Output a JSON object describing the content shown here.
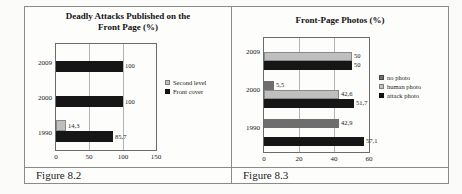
{
  "figures": [
    {
      "caption": "Figure 8.2"
    },
    {
      "caption": "Figure 8.3"
    }
  ],
  "colors": {
    "table_border": "#8a8a8a",
    "plot_border": "#6b6b6b",
    "gridline": "#b3b3b3",
    "black_series": "#161616",
    "light_gray_series": "#bfbfbf",
    "dark_gray_series": "#6e6e6e"
  },
  "chart_data": [
    {
      "type": "bar",
      "orientation": "horizontal",
      "title": "Deadly Attacks Published on the Front Page (%)",
      "title_lines": [
        "Deadly Attacks Published on the",
        "Front Page (%)"
      ],
      "categories": [
        "2009",
        "2000",
        "1990"
      ],
      "series": [
        {
          "name": "Second level",
          "color": "#bfbfbf",
          "light": true,
          "values": [
            0,
            0,
            14.3
          ],
          "labels": [
            "",
            "",
            "14,3"
          ]
        },
        {
          "name": "Front cover",
          "color": "#161616",
          "light": false,
          "values": [
            100,
            100,
            85.7
          ],
          "labels": [
            "100",
            "100",
            "85,7"
          ]
        }
      ],
      "xlim": [
        0,
        150
      ],
      "xticks": [
        "0",
        "50",
        "100",
        "150"
      ],
      "grid": true,
      "legend_position": "right"
    },
    {
      "type": "bar",
      "orientation": "horizontal",
      "title": "Front-Page Photos (%)",
      "title_lines": [
        "Front-Page Photos (%)"
      ],
      "categories": [
        "2009",
        "2000",
        "1990"
      ],
      "series": [
        {
          "name": "no photo",
          "color": "#6e6e6e",
          "light": false,
          "values": [
            0,
            5.5,
            42.9
          ],
          "labels": [
            "",
            "5,5",
            "42,9"
          ]
        },
        {
          "name": "human photo",
          "color": "#bfbfbf",
          "light": true,
          "values": [
            50,
            42.6,
            0
          ],
          "labels": [
            "50",
            "42,6",
            ""
          ]
        },
        {
          "name": "attack photo",
          "color": "#161616",
          "light": false,
          "values": [
            50,
            51.7,
            57.1
          ],
          "labels": [
            "50",
            "51,7",
            "57,1"
          ]
        }
      ],
      "xlim": [
        0,
        60
      ],
      "xticks": [
        "0",
        "20",
        "40",
        "60"
      ],
      "grid": true,
      "legend_position": "right"
    }
  ]
}
